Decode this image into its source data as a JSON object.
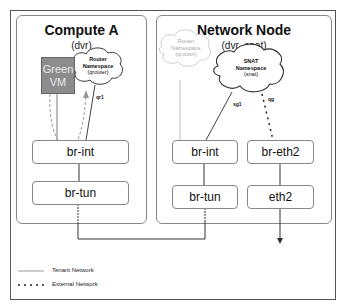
{
  "compute": {
    "title": "Compute A",
    "subtitle": "(dvr)",
    "vm": {
      "line1": "Green",
      "line2": "VM",
      "color": "#8c8c8c"
    },
    "router_ns": {
      "line1": "Router",
      "line2": "Namespace",
      "line3": "(qrouter)",
      "port": "qr1"
    },
    "bridges": {
      "br_int": "br-int",
      "br_tun": "br-tun"
    }
  },
  "network_node": {
    "title": "Network Node",
    "subtitle": "(dvr_snat)",
    "router_ns": {
      "line1": "Router",
      "line2": "Namespace",
      "line3": "(qrouter)"
    },
    "snat_ns": {
      "line1": "SNAT",
      "line2": "Namespace",
      "line3": "(snat)",
      "port_tenant": "sg1",
      "port_external": "qg"
    },
    "bridges": {
      "br_int": "br-int",
      "br_eth2": "br-eth2",
      "br_tun": "br-tun",
      "eth2": "eth2"
    }
  },
  "legend": {
    "tenant": "Tenant Network",
    "external": "External Network"
  }
}
